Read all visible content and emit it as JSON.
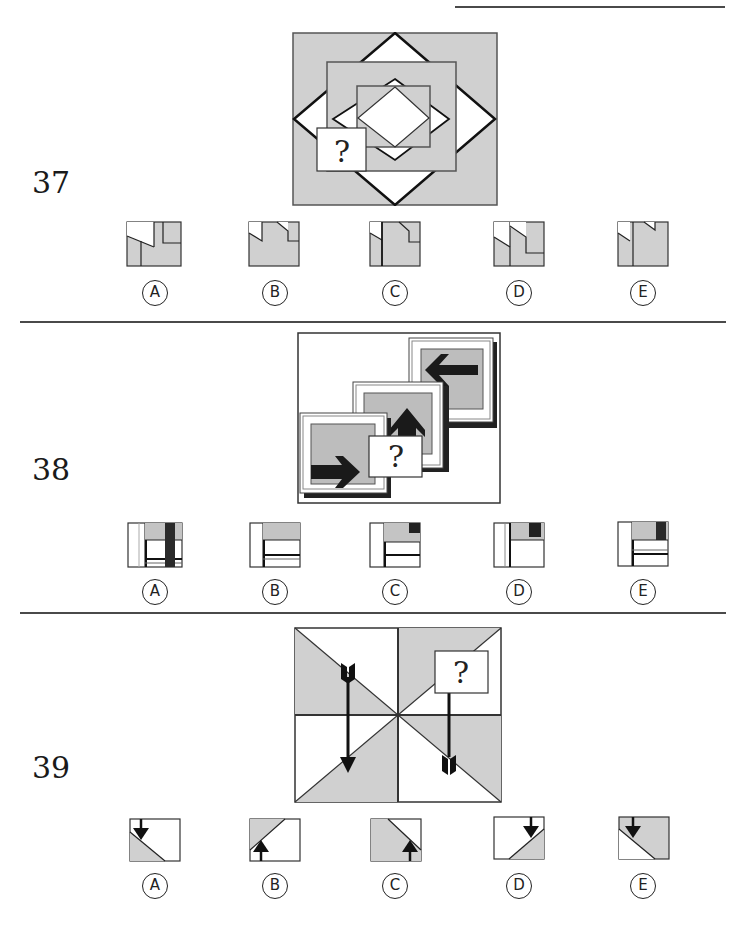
{
  "header": {
    "running_title": "Test Section"
  },
  "colors": {
    "shade": "#d0d0d0",
    "ink": "#222222",
    "paper": "#ffffff"
  },
  "questions": [
    {
      "number": "37",
      "figure": "nested-squares-and-diamonds-with-missing-piece",
      "missing_marker": "?",
      "options": [
        {
          "label": "A"
        },
        {
          "label": "B"
        },
        {
          "label": "C"
        },
        {
          "label": "D"
        },
        {
          "label": "E"
        }
      ]
    },
    {
      "number": "38",
      "figure": "three-stacked-cards-with-arrows-right-up-left",
      "missing_marker": "?",
      "options": [
        {
          "label": "A"
        },
        {
          "label": "B"
        },
        {
          "label": "C"
        },
        {
          "label": "D"
        },
        {
          "label": "E"
        }
      ]
    },
    {
      "number": "39",
      "figure": "quartered-square-with-diagonals-and-arrows",
      "missing_marker": "?",
      "options": [
        {
          "label": "A"
        },
        {
          "label": "B"
        },
        {
          "label": "C"
        },
        {
          "label": "D"
        },
        {
          "label": "E"
        }
      ]
    }
  ]
}
